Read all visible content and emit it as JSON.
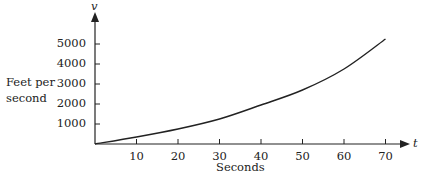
{
  "chart_data": {
    "type": "line",
    "title": "",
    "xlabel": "Seconds",
    "ylabel": "Feet per second",
    "x_axis_symbol": "t",
    "y_axis_symbol": "v",
    "x_ticks": [
      "10",
      "20",
      "30",
      "40",
      "50",
      "60",
      "70"
    ],
    "y_ticks": [
      "1000",
      "2000",
      "3000",
      "4000",
      "5000"
    ],
    "xlim": [
      0,
      72
    ],
    "ylim": [
      0,
      5600
    ],
    "grid": false,
    "legend": null,
    "series": [
      {
        "name": "velocity",
        "x": [
          0,
          10,
          20,
          30,
          40,
          50,
          60,
          70
        ],
        "values": [
          0,
          350,
          750,
          1250,
          1950,
          2700,
          3750,
          5250
        ]
      }
    ]
  },
  "labels": {
    "ylabel_line1": "Feet per",
    "ylabel_line2": "second"
  }
}
